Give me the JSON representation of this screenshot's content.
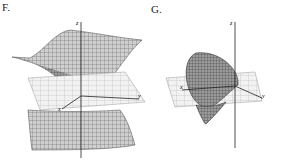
{
  "figures": [
    {
      "label": "F.",
      "axes": {
        "z": "z",
        "x": "x",
        "y": "y"
      },
      "surface": "hyperboloid-of-two-sheets"
    },
    {
      "label": "G.",
      "axes": {
        "z": "z",
        "x": "x",
        "y": "y"
      },
      "surface": "elliptic-cone-sideways"
    }
  ]
}
